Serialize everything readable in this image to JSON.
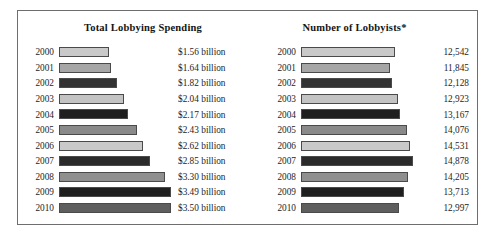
{
  "figure": {
    "border_color": "#6e6e6e",
    "background": "#ffffff"
  },
  "chart_data": [
    {
      "type": "bar",
      "orientation": "horizontal",
      "title": "Total Lobbying Spending",
      "xlabel": "",
      "ylabel": "",
      "grid": false,
      "legend": "none",
      "categories": [
        "2000",
        "2001",
        "2002",
        "2003",
        "2004",
        "2005",
        "2006",
        "2007",
        "2008",
        "2009",
        "2010"
      ],
      "values": [
        1.56,
        1.64,
        1.82,
        2.04,
        2.17,
        2.43,
        2.62,
        2.85,
        3.3,
        3.49,
        3.5
      ],
      "value_labels": [
        "$1.56 billion",
        "$1.64 billion",
        "$1.82 billion",
        "$2.04 billion",
        "$2.17 billion",
        "$2.43 billion",
        "$2.62 billion",
        "$2.85 billion",
        "$3.30 billion",
        "$3.49 billion",
        "$3.50 billion"
      ],
      "bar_colors": [
        "#c9c9c9",
        "#a6a6a6",
        "#333333",
        "#c3c3c3",
        "#1f1f1f",
        "#8a8a8a",
        "#c9c9c9",
        "#2b2b2b",
        "#8f8f8f",
        "#1f1f1f",
        "#5e5e5e"
      ],
      "xlim": [
        0,
        3.5
      ],
      "units": "billion USD"
    },
    {
      "type": "bar",
      "orientation": "horizontal",
      "title": "Number of Lobbyists*",
      "xlabel": "",
      "ylabel": "",
      "grid": false,
      "legend": "none",
      "categories": [
        "2000",
        "2001",
        "2002",
        "2003",
        "2004",
        "2005",
        "2006",
        "2007",
        "2008",
        "2009",
        "2010"
      ],
      "values": [
        12542,
        11845,
        12128,
        12923,
        13167,
        14076,
        14531,
        14878,
        14205,
        13713,
        12997
      ],
      "value_labels": [
        "12,542",
        "11,845",
        "12,128",
        "12,923",
        "13,167",
        "14,076",
        "14,531",
        "14,878",
        "14,205",
        "13,713",
        "12,997"
      ],
      "bar_colors": [
        "#c9c9c9",
        "#a6a6a6",
        "#333333",
        "#c3c3c3",
        "#1f1f1f",
        "#8a8a8a",
        "#c9c9c9",
        "#2b2b2b",
        "#8f8f8f",
        "#1f1f1f",
        "#5e5e5e"
      ],
      "xlim": [
        0,
        14878
      ],
      "units": "lobbyists"
    }
  ]
}
